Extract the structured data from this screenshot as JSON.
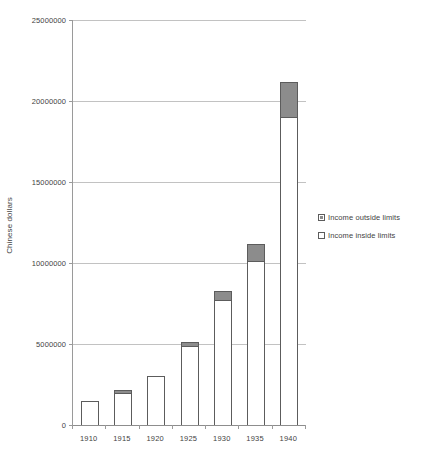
{
  "chart_data": {
    "type": "bar",
    "stacked": true,
    "title": "",
    "xlabel": "",
    "ylabel": "Chinese dollars",
    "categories": [
      "1910",
      "1915",
      "1920",
      "1925",
      "1930",
      "1935",
      "1940"
    ],
    "series": [
      {
        "name": "Income  inside limits",
        "color": "#ffffff",
        "values": [
          1500000,
          1950000,
          3000000,
          4850000,
          7700000,
          10100000,
          19000000
        ]
      },
      {
        "name": "Income  outside limits",
        "color": "#8c8c8c",
        "values": [
          0,
          50000,
          0,
          250000,
          600000,
          1100000,
          2200000
        ]
      }
    ],
    "totals": [
      1500000,
      2000000,
      3000000,
      5100000,
      8300000,
      11200000,
      21200000
    ],
    "ylim": [
      0,
      25000000
    ],
    "ytick_labels": [
      "0",
      "5000000",
      "10000000",
      "15000000",
      "20000000",
      "25000000"
    ],
    "ytick_values": [
      0,
      5000000,
      10000000,
      15000000,
      20000000,
      25000000
    ],
    "grid": true,
    "legend_position": "right",
    "legend_entries": [
      {
        "label": "Income  outside limits",
        "swatch": "outside"
      },
      {
        "label": "Income  inside limits",
        "swatch": "inside"
      }
    ]
  }
}
